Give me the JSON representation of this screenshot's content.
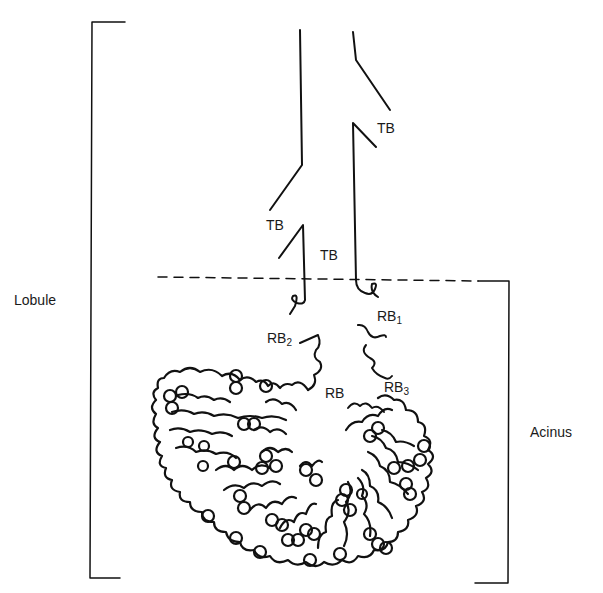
{
  "diagram": {
    "labels": {
      "lobule": "Lobule",
      "acinus": "Acinus",
      "tb_upper_right": "TB",
      "tb_left": "TB",
      "tb_center": "TB",
      "rb1_main": "RB",
      "rb1_sub": "1",
      "rb2_main": "RB",
      "rb2_sub": "2",
      "rb3_main": "RB",
      "rb3_sub": "3",
      "rb_center": "RB"
    },
    "colors": {
      "line": "#111111",
      "background": "#ffffff"
    }
  }
}
